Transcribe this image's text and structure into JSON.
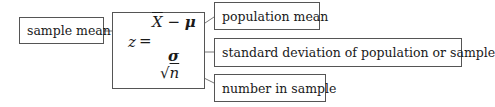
{
  "labels": {
    "sample_mean": "sample mean",
    "population_mean": "population mean",
    "std_dev": "standard deviation of population or sample",
    "number_in_sample": "number in sample"
  },
  "formula": {
    "lhs": "z",
    "equals": "=",
    "numerator_xbar": "X",
    "numerator_minus": " − ",
    "numerator_mu": "μ",
    "denominator_sigma": "σ",
    "sqrt_symbol": "√",
    "sqrt_n": "n"
  },
  "colors": {
    "border": "#555555",
    "line": "#777777",
    "text": "#1a1a1a"
  }
}
